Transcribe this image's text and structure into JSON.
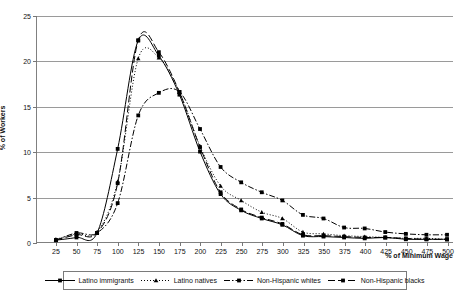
{
  "chart_data": {
    "type": "line",
    "title": "",
    "xlabel": "% of Minimum Wage",
    "ylabel": "% of Workers",
    "xlim": [
      25,
      500
    ],
    "ylim": [
      0,
      25
    ],
    "ytick_step": 5,
    "xtick_step": 25,
    "grid": true,
    "legend_position": "bottom",
    "categories": [
      25,
      50,
      75,
      100,
      125,
      150,
      175,
      200,
      225,
      250,
      275,
      300,
      325,
      350,
      375,
      400,
      425,
      450,
      475,
      500
    ],
    "series": [
      {
        "name": "Latino immigrants",
        "line_style": "solid",
        "marker": "square",
        "values": [
          0.2,
          0.5,
          1.0,
          10.3,
          22.3,
          20.6,
          16.3,
          10.0,
          5.3,
          3.5,
          2.6,
          1.9,
          0.7,
          0.6,
          0.5,
          0.4,
          0.5,
          0.3,
          0.3,
          0.3
        ]
      },
      {
        "name": "Latino natives",
        "line_style": "dotted",
        "marker": "triangle",
        "values": [
          0.3,
          0.9,
          1.1,
          6.7,
          20.3,
          20.4,
          16.6,
          10.6,
          6.2,
          4.6,
          3.3,
          2.6,
          1.1,
          0.9,
          0.7,
          0.6,
          0.5,
          0.4,
          0.4,
          0.3
        ]
      },
      {
        "name": "Non-Hispanic whites",
        "line_style": "dash-dot",
        "marker": "square",
        "values": [
          0.2,
          1.0,
          1.0,
          4.3,
          14.0,
          16.5,
          16.6,
          12.5,
          8.3,
          6.6,
          5.5,
          4.6,
          3.0,
          2.6,
          1.6,
          1.5,
          1.1,
          0.9,
          0.8,
          0.8
        ]
      },
      {
        "name": "Non-Hispanic blacks",
        "line_style": "long-dash",
        "marker": "square",
        "values": [
          0.2,
          0.8,
          1.0,
          6.5,
          22.3,
          21.0,
          16.6,
          10.5,
          5.5,
          3.6,
          2.7,
          2.0,
          0.8,
          0.7,
          0.6,
          0.5,
          0.5,
          0.4,
          0.3,
          0.3
        ]
      }
    ],
    "ytick_labels": [
      "0",
      "5",
      "10",
      "15",
      "20",
      "25"
    ],
    "xtick_labels": [
      "25",
      "50",
      "75",
      "100",
      "125",
      "150",
      "175",
      "200",
      "225",
      "250",
      "275",
      "300",
      "325",
      "350",
      "375",
      "400",
      "425",
      "450",
      "475",
      "500"
    ],
    "colors": {
      "series_line": "#000000",
      "grid": "#9a9a9a",
      "axis": "#808080",
      "background": "#ffffff"
    }
  },
  "legend": {
    "items": [
      {
        "label": "Latino immigrants"
      },
      {
        "label": "Latino natives"
      },
      {
        "label": "Non-Hispanic whites"
      },
      {
        "label": "Non-Hispanic blacks"
      }
    ]
  },
  "caption": {
    "text": ""
  }
}
